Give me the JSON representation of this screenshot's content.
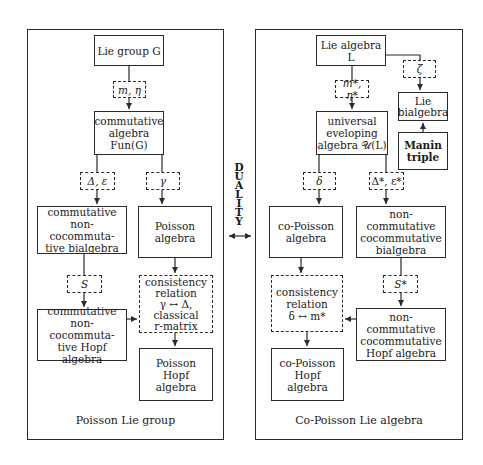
{
  "duality": {
    "letters": [
      "D",
      "U",
      "A",
      "L",
      "I",
      "T",
      "Y"
    ],
    "label": "DUALITY"
  },
  "left_panel": {
    "caption": "Poisson Lie group",
    "boxes": {
      "lie_group": "Lie group G",
      "comm_algebra": "commutative\nalgebra\nFun(G)",
      "comm_bialgebra": "commutative\nnon-cocommuta-\ntive bialgebra",
      "poisson_algebra": "Poisson\nalgebra",
      "consistency": "consistency\nrelation\nγ ↔ Δ,\nclassical\nr-matrix",
      "comm_hopf": "commutative\nnon-cocommuta-\ntive Hopf algebra",
      "poisson_hopf": "Poisson\nHopf\nalgebra"
    },
    "operations": {
      "m_eta": "m, η",
      "delta_eps": "Δ, ε",
      "gamma": "γ",
      "s": "S"
    }
  },
  "right_panel": {
    "caption": "Co-Poisson Lie algebra",
    "boxes": {
      "lie_algebra": "Lie algebra L",
      "lie_bialgebra": "Lie\nbialgebra",
      "manin_triple": "Manin\ntriple",
      "universal": "universal\neveloping\nalgebra 𝒰(L)",
      "copoisson_algebra": "co-Poisson\nalgebra",
      "nc_bialgebra": "non-commutative\ncocommutative\nbialgebra",
      "consistency": "consistency\nrelation\nδ ↔ m*",
      "nc_hopf": "non-commutative\ncocommutative\nHopf algebra",
      "copoisson_hopf": "co-Poisson\nHopf\nalgebra"
    },
    "operations": {
      "zeta": "ζ",
      "m_eta_star": "m*, η*",
      "delta": "δ",
      "delta_eps_star": "Δ*, ε*",
      "s_star": "S*"
    }
  }
}
